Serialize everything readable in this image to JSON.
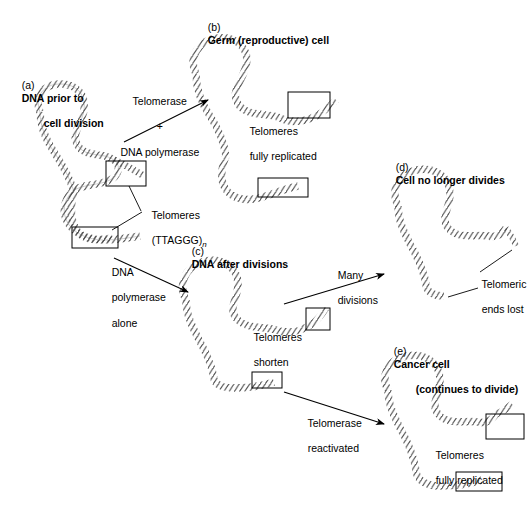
{
  "figure": {
    "title_kind": "telomere-replication-diagram",
    "background_color": "#ffffff",
    "line_color": "#000000",
    "dna_color": "#595959"
  },
  "panels": [
    {
      "id": "a",
      "tag": "(a)",
      "caption_line1": "DNA prior to",
      "caption_line2": "cell division"
    },
    {
      "id": "b",
      "tag": "(b)",
      "caption_line1": "Germ (reproductive) cell",
      "caption_line2": ""
    },
    {
      "id": "c",
      "tag": "(c)",
      "caption_line1": "DNA after divisions",
      "caption_line2": ""
    },
    {
      "id": "d",
      "tag": "(d)",
      "caption_line1": "Cell no longer divides",
      "caption_line2": ""
    },
    {
      "id": "e",
      "tag": "(e)",
      "caption_line1": "Cancer cell",
      "caption_line2": "(continues to divide)"
    }
  ],
  "annotations": {
    "arrow_ab_line1": "Telomerase",
    "arrow_ab_line2": "+",
    "arrow_ab_line3": "DNA polymerase",
    "arrow_ac_line1": "DNA",
    "arrow_ac_line2": "polymerase",
    "arrow_ac_line3": "alone",
    "arrow_cd_line1": "Many",
    "arrow_cd_line2": "divisions",
    "arrow_ce_line1": "Telomerase",
    "arrow_ce_line2": "reactivated",
    "telomeres_label_line1": "Telomeres",
    "telomeres_label_line2": "(TTAGGG)",
    "telomeres_label_subscript": "n",
    "b_state_line1": "Telomeres",
    "b_state_line2": "fully replicated",
    "c_state_line1": "Telomeres",
    "c_state_line2": "shorten",
    "d_state_line1": "Telomeric",
    "d_state_line2": "ends lost",
    "e_state_line1": "Telomeres",
    "e_state_line2": "fully replicated"
  }
}
